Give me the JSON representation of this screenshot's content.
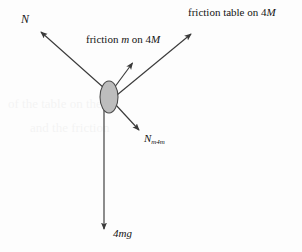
{
  "diagram": {
    "kind": "free-body-force-diagram",
    "background_color": "#fdfdfd",
    "stroke_color": "#3a3a3a",
    "body": {
      "shape": "ellipse",
      "fill_color": "#bdbdbd",
      "outline_color": "#4a4a4a",
      "center_x": 109,
      "center_y": 97,
      "radius_x": 9,
      "radius_y": 16
    },
    "forces": [
      {
        "id": "normal-table",
        "label_plain": "N",
        "label_symbol": "N",
        "subscript": "",
        "from_x": 104,
        "from_y": 88,
        "to_x": 38,
        "to_y": 29,
        "direction": "up-left"
      },
      {
        "id": "friction-m-on-4m",
        "label_plain": "friction m on 4M",
        "label_prefix": "friction ",
        "label_symbol_1": "m",
        "label_middle": " on 4",
        "label_symbol_2": "M",
        "from_x": 114,
        "from_y": 88,
        "to_x": 135,
        "to_y": 60,
        "direction": "up-right"
      },
      {
        "id": "friction-table-on-4m",
        "label_plain": "friction table on 4M",
        "label_prefix": "friction table on 4",
        "label_symbol_1": "M",
        "from_x": 117,
        "from_y": 94,
        "to_x": 194,
        "to_y": 31,
        "direction": "up-right-shallow"
      },
      {
        "id": "normal-m-on-4m",
        "label_plain": "Nm4m",
        "label_symbol": "N",
        "subscript": "m4m",
        "from_x": 115,
        "from_y": 104,
        "to_x": 142,
        "to_y": 133,
        "direction": "down-right"
      },
      {
        "id": "weight",
        "label_plain": "4mg",
        "label_prefix": "4",
        "label_symbol": "mg",
        "from_x": 104,
        "from_y": 106,
        "to_x": 104,
        "to_y": 233,
        "direction": "down"
      }
    ]
  },
  "labels": {
    "normal_table": "N",
    "friction_m_on_4m_prefix": "friction ",
    "friction_m_on_4m_sym1": "m",
    "friction_m_on_4m_mid": " on 4",
    "friction_m_on_4m_sym2": "M",
    "friction_table_prefix": "friction table on 4",
    "friction_table_sym": "M",
    "normal_m4m_sym": "N",
    "normal_m4m_sub": "m4m",
    "weight_num": "4",
    "weight_sym": "mg"
  },
  "ghost_text": {
    "line_1": "of the table on the 4",
    "line_2": "and the friction"
  }
}
